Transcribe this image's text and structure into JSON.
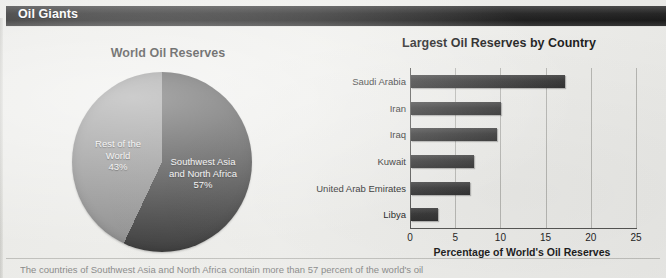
{
  "figure": {
    "title": "Oil Giants",
    "caption": "The countries of Southwest Asia and North Africa contain more than 57 percent of the world's oil"
  },
  "colors": {
    "title_bar": "#1a1a1a",
    "pie_dark": "#3b3b3b",
    "pie_light": "#8e8e8e",
    "bar_fill": "#343434",
    "gridline": "#b9b9b5",
    "background": "#efefec"
  },
  "chart_data": [
    {
      "type": "pie",
      "title": "World Oil Reserves",
      "categories": [
        "Southwest Asia and North Africa",
        "Rest of the World"
      ],
      "values": [
        57,
        43
      ],
      "unit": "percent",
      "labels": [
        {
          "name": "Southwest Asia and North Africa",
          "line1": "Southwest Asia",
          "line2": "and North Africa",
          "percent": "57%",
          "color": "#3b3b3b"
        },
        {
          "name": "Rest of the World",
          "line1": "Rest of the",
          "line2": "World",
          "percent": "43%",
          "color": "#8e8e8e"
        }
      ],
      "legend": "none"
    },
    {
      "type": "bar",
      "orientation": "horizontal",
      "title": "Largest Oil Reserves by Country",
      "categories": [
        "Saudi Arabia",
        "Iran",
        "Iraq",
        "Kuwait",
        "United Arab Emirates",
        "Libya"
      ],
      "values": [
        17,
        10,
        9.5,
        7,
        6.5,
        3
      ],
      "xlabel": "Percentage of World's Oil Reserves",
      "ylabel": "",
      "xlim": [
        0,
        25
      ],
      "xticks": [
        "0",
        "5",
        "10",
        "15",
        "20",
        "25"
      ],
      "grid": "vertical",
      "legend": "none"
    }
  ]
}
